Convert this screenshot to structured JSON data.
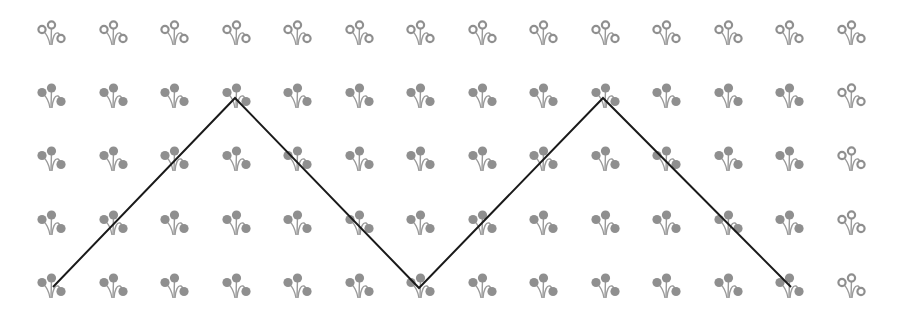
{
  "chart_data": {
    "type": "pictogram-grid-with-line",
    "title": "",
    "grid": {
      "columns": 14,
      "rows": 5,
      "column_centers_x": [
        51,
        113,
        174,
        236,
        297,
        359,
        420,
        482,
        543,
        605,
        666,
        728,
        789,
        851
      ],
      "row_bottoms_y": [
        45,
        108,
        171,
        235,
        298
      ],
      "icon": "flower-icon",
      "states": {
        "outline": "unfilled flower (hollow circles)",
        "filled": "filled flower (solid circles)"
      },
      "outline_cells_rule": "row 0 and column 13 are outline; all other cells are filled"
    },
    "line": {
      "color": "#1a1a1a",
      "width": 2,
      "points": [
        {
          "col": 0,
          "row": 4,
          "x": 53,
          "y": 287
        },
        {
          "col": 3,
          "row": 1,
          "x": 235,
          "y": 98
        },
        {
          "col": 6,
          "row": 4,
          "x": 419,
          "y": 288
        },
        {
          "col": 9,
          "row": 1,
          "x": 603,
          "y": 98
        },
        {
          "col": 12,
          "row": 4,
          "x": 791,
          "y": 287
        }
      ]
    },
    "colors": {
      "icon": "#8f8f8f",
      "icon_stem": "#9a9a9a",
      "background": "#ffffff"
    },
    "xlabel": "",
    "ylabel": "",
    "legend": []
  }
}
